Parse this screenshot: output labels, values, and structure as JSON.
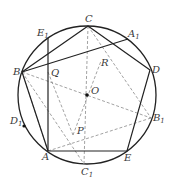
{
  "diagram": {
    "type": "geometry",
    "colors": {
      "solid": "#222222",
      "dashed": "#888888",
      "label": "#3a3a3a"
    },
    "circle": {
      "cx": 87,
      "cy": 95,
      "r": 69
    },
    "points": {
      "O": {
        "x": 87,
        "y": 95,
        "label": "O"
      },
      "A": {
        "x": 48,
        "y": 151,
        "label": "A"
      },
      "B": {
        "x": 22,
        "y": 72,
        "label": "B"
      },
      "C": {
        "x": 88,
        "y": 26,
        "label": "C"
      },
      "D": {
        "x": 150,
        "y": 70,
        "label": "D"
      },
      "E": {
        "x": 127,
        "y": 151,
        "label": "E"
      },
      "A1": {
        "x": 128,
        "y": 39,
        "label": "A",
        "sub": "1"
      },
      "B1": {
        "x": 151,
        "y": 118,
        "label": "B",
        "sub": "1"
      },
      "C1": {
        "x": 84,
        "y": 164,
        "label": "C",
        "sub": "1"
      },
      "D1": {
        "x": 24,
        "y": 126,
        "label": "D",
        "sub": "1"
      },
      "E1": {
        "x": 48,
        "y": 38,
        "label": "E",
        "sub": "1"
      },
      "P": {
        "x": 73,
        "y": 135,
        "label": "P"
      },
      "Q": {
        "x": 48,
        "y": 72,
        "label": "Q"
      },
      "R": {
        "x": 101,
        "y": 61,
        "label": "R"
      }
    },
    "labels": {
      "O": "O",
      "A": "A",
      "B": "B",
      "C": "C",
      "D": "D",
      "E": "E",
      "A1": "A",
      "B1": "B",
      "C1": "C",
      "D1": "D",
      "E1": "E",
      "P": "P",
      "Q": "Q",
      "R": "R",
      "sub1": "1"
    },
    "solid_segments": [
      [
        "A",
        "B"
      ],
      [
        "B",
        "C"
      ],
      [
        "C",
        "D"
      ],
      [
        "D",
        "E"
      ],
      [
        "E",
        "A"
      ],
      [
        "B",
        "A1"
      ],
      [
        "E1",
        "A"
      ]
    ],
    "dashed_segments": [
      [
        "B",
        "B1"
      ],
      [
        "A",
        "B1"
      ],
      [
        "C",
        "C1"
      ],
      [
        "B",
        "E"
      ],
      [
        "Q",
        "P"
      ],
      [
        "P",
        "R"
      ],
      [
        "R",
        "Q"
      ],
      [
        "C",
        "B1"
      ]
    ]
  }
}
